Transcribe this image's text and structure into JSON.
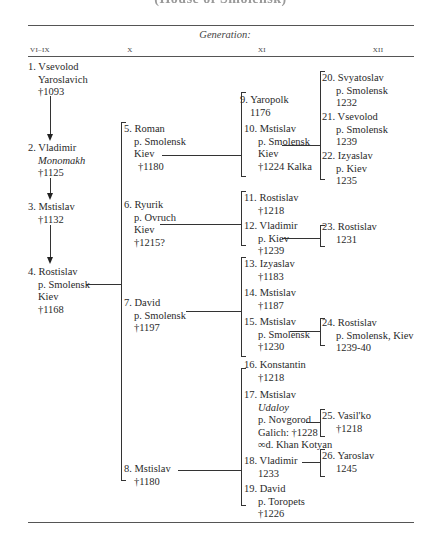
{
  "title": "(House of Smolensk)",
  "header": {
    "generation_label": "Generation:",
    "columns": [
      "VI–IX",
      "X",
      "XI",
      "XII"
    ]
  },
  "generation_vi_ix": [
    {
      "num": "1.",
      "lines": [
        "Vsevolod",
        "Yaroslavich",
        "†1093"
      ]
    },
    {
      "num": "2.",
      "lines": [
        "Vladimir",
        "Monomakh",
        "†1125"
      ]
    },
    {
      "num": "3.",
      "lines": [
        "Mstislav",
        "†1132"
      ]
    },
    {
      "num": "4.",
      "lines": [
        "Rostislav",
        "p. Smolensk",
        "Kiev",
        "†1168"
      ]
    }
  ],
  "generation_x": [
    {
      "num": "5.",
      "lines": [
        "Roman",
        "p. Smolensk",
        "Kiev",
        "†1180"
      ]
    },
    {
      "num": "6.",
      "lines": [
        "Ryurik",
        "p. Ovruch",
        "Kiev",
        "†1215?"
      ]
    },
    {
      "num": "7.",
      "lines": [
        "David",
        "p. Smolensk",
        "†1197"
      ]
    },
    {
      "num": "8.",
      "lines": [
        "Mstislav",
        "†1180"
      ]
    }
  ],
  "generation_xi": [
    {
      "num": "9.",
      "lines": [
        "Yaropolk",
        "1176"
      ]
    },
    {
      "num": "10.",
      "lines": [
        "Mstislav",
        "p. Smolensk",
        "Kiev",
        "†1224 Kalka"
      ]
    },
    {
      "num": "11.",
      "lines": [
        "Rostislav",
        "†1218"
      ]
    },
    {
      "num": "12.",
      "lines": [
        "Vladimir",
        "p. Kiev",
        "†1239"
      ]
    },
    {
      "num": "13.",
      "lines": [
        "Izyaslav",
        "†1183"
      ]
    },
    {
      "num": "14.",
      "lines": [
        "Mstislav",
        "†1187"
      ]
    },
    {
      "num": "15.",
      "lines": [
        "Mstislav",
        "p. Smolensk",
        "†1230"
      ]
    },
    {
      "num": "16.",
      "lines": [
        "Konstantin",
        "†1218"
      ]
    },
    {
      "num": "17.",
      "lines": [
        "Mstislav",
        "Udaloy",
        "p. Novgorod",
        "Galich: †1228",
        "∞d. Khan Kotyan"
      ]
    },
    {
      "num": "18.",
      "lines": [
        "Vladimir",
        "1233"
      ]
    },
    {
      "num": "19.",
      "lines": [
        "David",
        "p. Toropets",
        "†1226"
      ]
    }
  ],
  "generation_xii": [
    {
      "num": "20.",
      "lines": [
        "Svyatoslav",
        "p. Smolensk",
        "1232"
      ]
    },
    {
      "num": "21.",
      "lines": [
        "Vsevolod",
        "p. Smolensk",
        "1239"
      ]
    },
    {
      "num": "22.",
      "lines": [
        "Izyaslav",
        "p. Kiev",
        "1235"
      ]
    },
    {
      "num": "23.",
      "lines": [
        "Rostislav",
        "1231"
      ]
    },
    {
      "num": "24.",
      "lines": [
        "Rostislav",
        "p. Smolensk, Kiev",
        "1239-40"
      ]
    },
    {
      "num": "25.",
      "lines": [
        "Vasil'ko",
        "†1218"
      ]
    },
    {
      "num": "26.",
      "lines": [
        "Yaroslav",
        "1245"
      ]
    }
  ]
}
